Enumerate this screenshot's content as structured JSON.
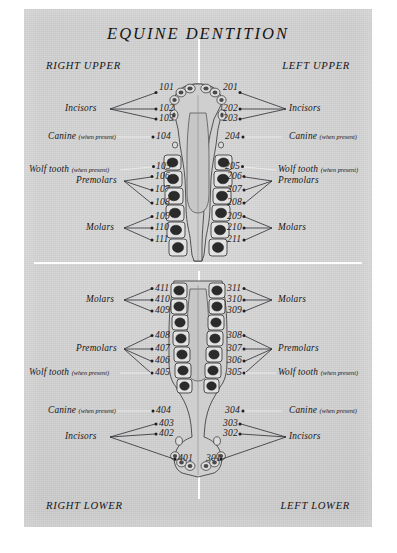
{
  "plate": {
    "title": "EQUINE DENTITION",
    "background_color": "#d4d4d4",
    "ink_color": "#1c1c20"
  },
  "quadrants": {
    "right_upper": "RIGHT UPPER",
    "left_upper": "LEFT UPPER",
    "right_lower": "RIGHT LOWER",
    "left_lower": "LEFT LOWER"
  },
  "group_labels": {
    "incisors": "Incisors",
    "canine": "Canine",
    "wolf_tooth": "Wolf tooth",
    "premolars": "Premolars",
    "molars": "Molars",
    "when_present": "(when present)"
  },
  "tooth_numbers": {
    "right_upper": [
      "101",
      "102",
      "103",
      "104",
      "105",
      "106",
      "107",
      "108",
      "109",
      "110",
      "111"
    ],
    "left_upper": [
      "201",
      "202",
      "203",
      "204",
      "205",
      "206",
      "207",
      "208",
      "209",
      "210",
      "211"
    ],
    "left_lower": [
      "301",
      "302",
      "303",
      "304",
      "305",
      "306",
      "307",
      "308",
      "309",
      "310",
      "311"
    ],
    "right_lower": [
      "401",
      "402",
      "403",
      "404",
      "405",
      "406",
      "407",
      "408",
      "409",
      "410",
      "411"
    ]
  },
  "diagram": {
    "upper_arcade_name": "maxilla-occlusal-view",
    "lower_arcade_name": "mandible-occlusal-view"
  }
}
